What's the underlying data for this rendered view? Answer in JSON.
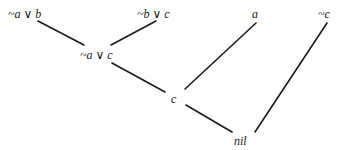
{
  "diagram": {
    "type": "resolution-refutation-tree",
    "nodes": [
      {
        "id": "n1",
        "label": "~a ∨ b"
      },
      {
        "id": "n2",
        "label": "~b ∨ c"
      },
      {
        "id": "n3",
        "label": "~a ∨ c"
      },
      {
        "id": "n4",
        "label": "a"
      },
      {
        "id": "n5",
        "label": "c"
      },
      {
        "id": "n6",
        "label": "~c"
      },
      {
        "id": "n7",
        "label": "nil"
      }
    ],
    "edges": [
      {
        "from": "n1",
        "to": "n3"
      },
      {
        "from": "n2",
        "to": "n3"
      },
      {
        "from": "n3",
        "to": "n5"
      },
      {
        "from": "n4",
        "to": "n5"
      },
      {
        "from": "n5",
        "to": "n7"
      },
      {
        "from": "n6",
        "to": "n7"
      }
    ],
    "colors": {
      "ink": "#1a1a1a",
      "background": "#ffffff"
    }
  }
}
